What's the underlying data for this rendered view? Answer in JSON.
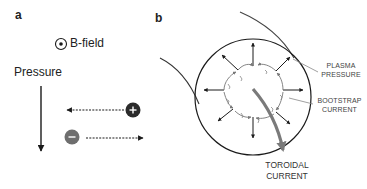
{
  "panel_a": {
    "label": "a",
    "bfield_label": "B-field",
    "pressure_label": "Pressure",
    "positive_charge_symbol": "+",
    "negative_charge_symbol": "−"
  },
  "panel_b": {
    "label": "b",
    "plasma_pressure_label_line1": "PLASMA",
    "plasma_pressure_label_line2": "PRESSURE",
    "bootstrap_current_label_line1": "BOOTSTRAP",
    "bootstrap_current_label_line2": "CURRENT",
    "toroidal_current_label_line1": "TOROIDAL",
    "toroidal_current_label_line2": "CURRENT"
  },
  "colors": {
    "line": "#1a1a1a",
    "positive_charge": "#2b2b2b",
    "negative_charge": "#6e6e6e",
    "toroidal_arrow": "#7a7a7a",
    "pointer_lines": "#888888"
  }
}
